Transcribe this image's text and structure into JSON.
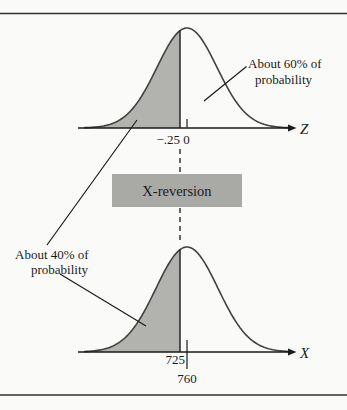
{
  "figure": {
    "top_chart": {
      "axis_label": "Z",
      "tick_boundary": "−.25",
      "tick_center": "0",
      "annotation_line1": "About 60% of",
      "annotation_line2": "probability"
    },
    "reversion_box": {
      "label": "X-reversion"
    },
    "bottom_chart": {
      "axis_label": "X",
      "tick_boundary": "725",
      "tick_center": "760",
      "annotation_line1": "About 40% of",
      "annotation_line2": "probability"
    },
    "colors": {
      "background": "#fafaf8",
      "shade": "#b2b2af",
      "box": "#a9a9a6",
      "curve_stroke": "#414141",
      "ink": "#1a1a1a"
    }
  },
  "chart_data": [
    {
      "type": "area",
      "title": "Standard normal distribution of Z",
      "xlabel": "Z",
      "distribution": "normal",
      "mean": 0,
      "ticks": [
        -0.25,
        0
      ],
      "tick_labels": [
        "−.25",
        "0"
      ],
      "shaded_region": {
        "from": "-infinity",
        "to": -0.25,
        "label": "About 40% of probability"
      },
      "unshaded_region": {
        "from": -0.25,
        "to": "infinity",
        "label": "About 60% of probability"
      },
      "grid": false,
      "legend": false
    },
    {
      "type": "area",
      "title": "Distribution of X after X-reversion",
      "xlabel": "X",
      "distribution": "normal",
      "mean": 760,
      "ticks": [
        725,
        760
      ],
      "tick_labels": [
        "725",
        "760"
      ],
      "shaded_region": {
        "from": "-infinity",
        "to": 725,
        "label": "About 40% of probability"
      },
      "unshaded_region": {
        "from": 725,
        "to": "infinity",
        "label": "About 60% of probability"
      },
      "grid": false,
      "legend": false
    }
  ],
  "transformation": {
    "label": "X-reversion",
    "maps": "Z = −.25  →  X = 725"
  }
}
